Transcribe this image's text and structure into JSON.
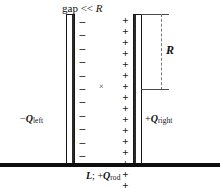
{
  "figure": {
    "title_label": "gap << R",
    "gap_text_prefix": "gap << ",
    "gap_text_var": "R",
    "dimension_label": "R",
    "center_marker": "×",
    "left_plate": {
      "charge_sign": "−",
      "charge_label_sign": "−",
      "charge_label_symbol": "Q",
      "charge_label_subscript": "left",
      "sign_count": 11,
      "signs": [
        "−",
        "−",
        "−",
        "−",
        "−",
        "−",
        "−",
        "−",
        "−",
        "−",
        "−"
      ]
    },
    "right_plate": {
      "charge_sign": "+",
      "charge_label_sign": "+",
      "charge_label_symbol": "Q",
      "charge_label_subscript": "right",
      "sign_count": 16,
      "signs": [
        "+",
        "+",
        "+",
        "+",
        "+",
        "+",
        "+",
        "+",
        "+",
        "+",
        "+",
        "+",
        "+",
        "+",
        "+",
        "+"
      ]
    },
    "rod": {
      "length_symbol": "L",
      "separator": "; +",
      "charge_symbol": "Q",
      "charge_subscript": "rod"
    },
    "colors": {
      "ink": "#101010",
      "plate_fill": "#ffffff",
      "plate_edge": "#151515",
      "plate_shade": "#2b2b2b",
      "rod": "#0d0d0d",
      "dimension_line": "#7a7a7a",
      "background": "#ffffff"
    }
  }
}
